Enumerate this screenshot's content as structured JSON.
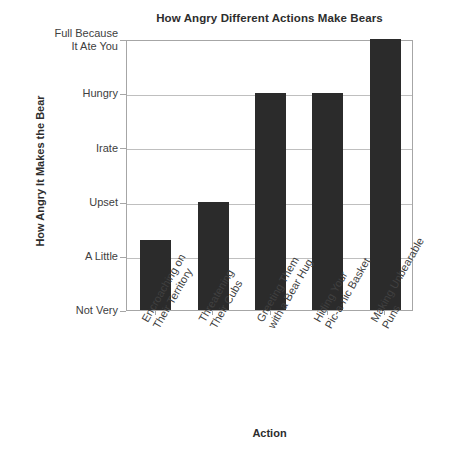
{
  "chart_data": {
    "type": "bar",
    "title": "How Angry Different Actions Make Bears",
    "xlabel": "Action",
    "ylabel": "How Angry It Makes the Bear",
    "categories": [
      "Encroaching on\nTheir Territory",
      "Threatening\nTheir Cubs",
      "Greeting Them\nwith a Bear Hug",
      "Hiding Your\nPic-a-nic Basket",
      "Making Unbearable\nPuns"
    ],
    "values": [
      1.3,
      2,
      4,
      4,
      5
    ],
    "ytick_labels": [
      "Not Very",
      "A Little",
      "Upset",
      "Irate",
      "Hungry",
      "Full Because\nIt Ate You"
    ],
    "ytick_values": [
      0,
      1,
      2,
      3,
      4,
      5
    ],
    "ylim": [
      0,
      5
    ],
    "grid": true,
    "legend": "none",
    "bar_color": "#2b2b2b",
    "grid_color": "#bfbfbf",
    "axis_color": "#a6a6a6",
    "background_color": "#ffffff"
  }
}
